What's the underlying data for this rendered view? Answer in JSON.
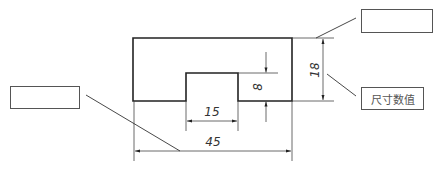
{
  "diagram": {
    "type": "engineering-drawing-dimensioning",
    "dimensions": {
      "overall_width": "45",
      "notch_width": "15",
      "notch_depth": "8",
      "overall_height": "18"
    },
    "labels": {
      "top_right_box": "",
      "middle_right_box": "尺寸数值",
      "left_box": ""
    },
    "colors": {
      "outline": "#222222",
      "thin_line": "#444444",
      "box_border": "#555555"
    }
  }
}
